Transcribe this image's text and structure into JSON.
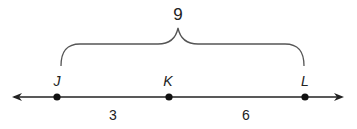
{
  "diagram": {
    "type": "number-line-segment",
    "points": [
      {
        "label": "J",
        "x": 57
      },
      {
        "label": "K",
        "x": 169
      },
      {
        "label": "L",
        "x": 305
      }
    ],
    "segments": [
      {
        "from": "J",
        "to": "K",
        "length": "3"
      },
      {
        "from": "K",
        "to": "L",
        "length": "6"
      }
    ],
    "total": {
      "from": "J",
      "to": "L",
      "length": "9"
    },
    "colors": {
      "line": "#222222",
      "point": "#111111",
      "brace": "#555555"
    }
  }
}
